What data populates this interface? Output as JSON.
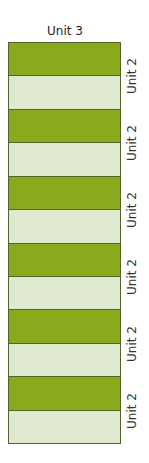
{
  "title": "Unit 3",
  "colors": {
    "dark": "#8aaa1e",
    "light": "#dfe9cf",
    "border": "#55622e"
  },
  "stripes": [
    "dark",
    "light",
    "dark",
    "light",
    "dark",
    "light",
    "dark",
    "light",
    "dark",
    "light",
    "dark",
    "light"
  ],
  "labels": [
    "Unit 2",
    "Unit 2",
    "Unit 2",
    "Unit 2",
    "Unit 2",
    "Unit 2"
  ]
}
